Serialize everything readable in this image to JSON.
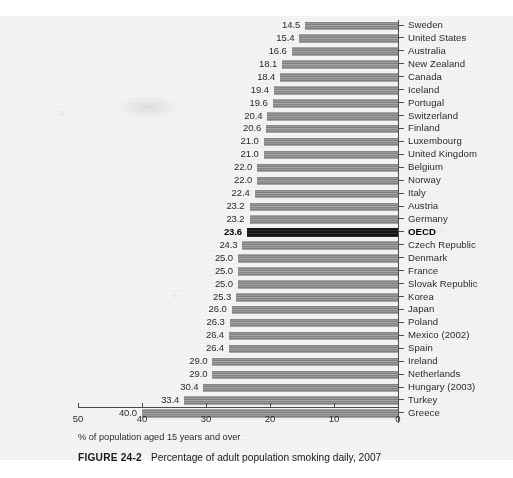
{
  "figure": {
    "number_label": "FIGURE 24-2",
    "caption_text": "Percentage of adult population smoking daily, 2007",
    "axis_note": "% of population aged 15 years and over"
  },
  "chart_data": {
    "type": "bar",
    "orientation": "horizontal",
    "title": "Percentage of adult population smoking daily, 2007",
    "xlabel": "% of population aged 15 years and over",
    "ylabel": "",
    "xlim": [
      50,
      0
    ],
    "x_reversed": true,
    "xticks": [
      "50",
      "40",
      "30",
      "20",
      "10",
      "0"
    ],
    "xtick_values": [
      50,
      40,
      30,
      20,
      10,
      0
    ],
    "grid": false,
    "legend": "none",
    "value_labels_shown": true,
    "highlight_category": "OECD",
    "highlight_color": "#121212",
    "bar_color": "#8d8d8d",
    "categories": [
      "Sweden",
      "United States",
      "Australia",
      "New Zealand",
      "Canada",
      "Iceland",
      "Portugal",
      "Switzerland",
      "Finland",
      "Luxembourg",
      "United Kingdom",
      "Belgium",
      "Norway",
      "Italy",
      "Austria",
      "Germany",
      "OECD",
      "Czech Republic",
      "Denmark",
      "France",
      "Slovak Republic",
      "Korea",
      "Japan",
      "Poland",
      "Mexico (2002)",
      "Spain",
      "Ireland",
      "Netherlands",
      "Hungary (2003)",
      "Turkey",
      "Greece"
    ],
    "values": [
      14.5,
      15.4,
      16.6,
      18.1,
      18.4,
      19.4,
      19.6,
      20.4,
      20.6,
      21.0,
      21.0,
      22.0,
      22.0,
      22.4,
      23.2,
      23.2,
      23.6,
      24.3,
      25.0,
      25.0,
      25.0,
      25.3,
      26.0,
      26.3,
      26.4,
      26.4,
      29.0,
      29.0,
      30.4,
      33.4,
      40.0
    ],
    "value_labels": [
      "14.5",
      "15.4",
      "16.6",
      "18.1",
      "18.4",
      "19.4",
      "19.6",
      "20.4",
      "20.6",
      "21.0",
      "21.0",
      "22.0",
      "22.0",
      "22.4",
      "23.2",
      "23.2",
      "23.6",
      "24.3",
      "25.0",
      "25.0",
      "25.0",
      "25.3",
      "26.0",
      "26.3",
      "26.4",
      "26.4",
      "29.0",
      "29.0",
      "30.4",
      "33.4",
      "40.0"
    ]
  }
}
